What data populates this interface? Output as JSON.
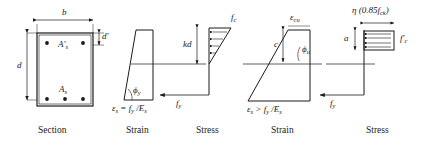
{
  "figure": {
    "captions": [
      {
        "name": "caption-section",
        "text": "Section",
        "x": 38,
        "y": 126
      },
      {
        "name": "caption-strain-yield",
        "text": "Strain",
        "x": 126,
        "y": 126
      },
      {
        "name": "caption-stress-yield",
        "text": "Stress",
        "x": 196,
        "y": 126
      },
      {
        "name": "caption-strain-ultimate",
        "text": "Strain",
        "x": 271,
        "y": 126
      },
      {
        "name": "caption-stress-ultimate",
        "text": "Stress",
        "x": 366,
        "y": 126
      }
    ],
    "section": {
      "width_label": "b",
      "depth_label": "d",
      "cover_label": "d′",
      "top_steel_label": "A′",
      "top_steel_sub": "s",
      "bottom_steel_label": "A",
      "bottom_steel_sub": "s",
      "top_bar_count": 2,
      "bottom_bar_count": 3
    },
    "strain_yield": {
      "angle_label": "ϕ",
      "angle_sub": "y",
      "equation_eps": "ε",
      "equation_eps_sub": "s",
      "equation_rest": " = f",
      "equation_fy_sub": "y",
      "equation_tail": " /E",
      "equation_es_sub": "s"
    },
    "stress_yield": {
      "neutral_axis_label": "kd",
      "concrete_stress_label": "f",
      "concrete_stress_sub": "c",
      "steel_stress_label": "f",
      "steel_stress_sub": "y"
    },
    "strain_ultimate": {
      "top_strain_label": "ε",
      "top_strain_sub": "cu",
      "depth_label": "c",
      "angle_label": "ϕ",
      "angle_sub": "u",
      "equation_eps": "ε",
      "equation_eps_sub": "s",
      "equation_rest": " > f",
      "equation_fy_sub": "y",
      "equation_tail": " /E",
      "equation_es_sub": "s"
    },
    "stress_ultimate": {
      "block_stress_eta": "η",
      "block_stress_expr": " (0.85f",
      "block_stress_sub": "ck",
      "block_stress_close": ")",
      "block_depth_label": "a",
      "concrete_stress_label": "f′",
      "concrete_stress_sub": "c",
      "steel_stress_label": "f",
      "steel_stress_sub": "y",
      "arrow_count": 4
    },
    "colors": {
      "line": "#1a1a1a",
      "background": "#ffffff",
      "section_fill": "#ffffff"
    }
  }
}
